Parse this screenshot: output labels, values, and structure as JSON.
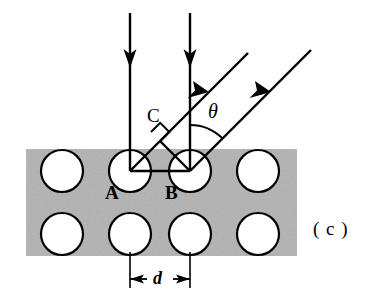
{
  "figure": {
    "panel_label": "( c )",
    "type": "physics-diagram"
  },
  "labels": {
    "atom_a": "A",
    "atom_b": "B",
    "foot_c": "C",
    "angle_theta": "θ",
    "spacing_d": "d"
  },
  "colors": {
    "slab_fill": "#b2b2b2",
    "circle_fill": "#ffffff",
    "stroke": "#000000",
    "background": "#ffffff"
  },
  "geometry": {
    "slab": {
      "x": 26,
      "y": 149,
      "width": 271,
      "height": 107
    },
    "circle_radius": 21,
    "row_top_y": 171,
    "row_bottom_y": 234,
    "column_centers": [
      62,
      130,
      190,
      258
    ],
    "lattice_spacing_px": 60,
    "incident_rays": [
      {
        "name": "incident-ray-left",
        "x": 130,
        "y_start": 13,
        "y_end": 171,
        "arrow_y": 57
      },
      {
        "name": "incident-ray-right",
        "x": 190,
        "y_start": 13,
        "y_end": 171,
        "arrow_y": 57
      }
    ],
    "outgoing_rays": [
      {
        "name": "outgoing-ray-from-a",
        "x1": 130,
        "y1": 171,
        "x2": 248,
        "y2": 53,
        "arrow_t": 0.62
      },
      {
        "name": "outgoing-ray-from-b",
        "x1": 190,
        "y1": 171,
        "x2": 311,
        "y2": 50,
        "arrow_t": 0.62
      }
    ],
    "perpendicular_foot": {
      "x": 160,
      "y": 141
    },
    "right_angle_marker_size": 13,
    "baseline_ab": {
      "x1": 130,
      "y1": 171,
      "x2": 190,
      "y2": 171
    },
    "theta_arc_radius": 46,
    "dimension_line_y": 279,
    "dimension_extension_top_y": 252
  },
  "annotations": {
    "angle_value_degrees": 45,
    "description": "Two parallel vertical rays strike atoms A and B on the top lattice row and scatter upward to the right at angle theta from the surface normal reference; C marks the perpendicular foot of the path-difference segment; d is the horizontal lattice spacing between A and B."
  }
}
